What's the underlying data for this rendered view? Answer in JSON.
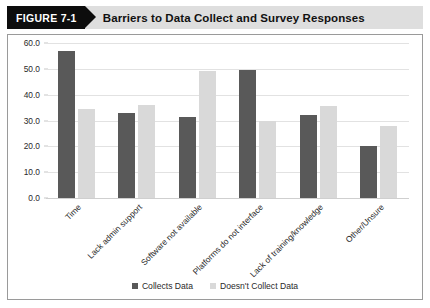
{
  "banner": {
    "tag": "FIGURE 7-1",
    "title": "Barriers to Data Collect and Survey Responses"
  },
  "colors": {
    "series_collects": "#595959",
    "series_doesnt_collect": "#d9d9d9",
    "banner_tag_bg": "#0d0d0d",
    "banner_bg": "#dedede",
    "gridline": "#e2e2e2",
    "frame_border": "#9a9a9a"
  },
  "chart_data": {
    "type": "bar",
    "title": "Barriers to Data Collect and Survey Responses",
    "xlabel": "",
    "ylabel": "",
    "ylim": [
      0,
      60
    ],
    "ytick_step": 10,
    "ytick_labels": [
      "60.0",
      "50.0",
      "40.0",
      "30.0",
      "20.0",
      "10.0",
      "0.0"
    ],
    "ytick_values": [
      60,
      50,
      40,
      30,
      20,
      10,
      0
    ],
    "grid": true,
    "legend_position": "bottom",
    "categories": [
      "Time",
      "Lack admin support",
      "Software not available",
      "Platforms do not interface",
      "Lack of training/knowledge",
      "Other/Unsure"
    ],
    "series": [
      {
        "name": "Collects Data",
        "color": "#595959",
        "values": [
          57.0,
          33.0,
          31.5,
          49.5,
          32.0,
          20.0
        ]
      },
      {
        "name": "Doesn't Collect Data",
        "color": "#d9d9d9",
        "values": [
          34.5,
          36.0,
          49.0,
          30.0,
          35.5,
          28.0
        ]
      }
    ]
  }
}
